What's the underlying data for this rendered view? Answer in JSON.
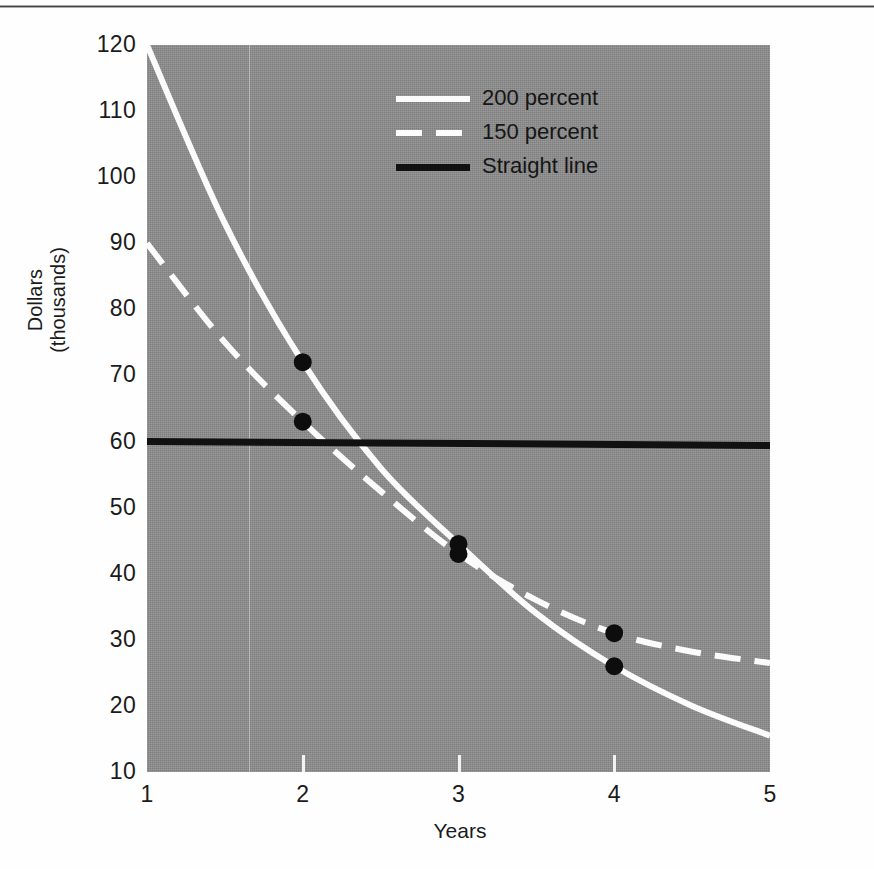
{
  "figure": {
    "background_color": "#fefefe",
    "plot_background_color": "#8d8d8d"
  },
  "chart_data": {
    "type": "line",
    "title": "",
    "xlabel": "Years",
    "ylabel": "Dollars\n(thousands)",
    "xlim": [
      1,
      5
    ],
    "ylim": [
      10,
      120
    ],
    "xticks": [
      "1",
      "2",
      "3",
      "4",
      "5"
    ],
    "yticks": [
      "10",
      "20",
      "30",
      "40",
      "50",
      "60",
      "70",
      "80",
      "90",
      "100",
      "110",
      "120"
    ],
    "grid": false,
    "legend_position": "upper right",
    "series": [
      {
        "name": "200 percent",
        "style": "solid",
        "color": "#fbfbfb",
        "x": [
          1,
          1.5,
          2,
          2.5,
          3,
          3.5,
          4,
          4.5,
          5
        ],
        "values": [
          120,
          93,
          72,
          56,
          44.5,
          34,
          26,
          20,
          15.5
        ],
        "markers": [
          {
            "x": 2,
            "y": 72
          },
          {
            "x": 3,
            "y": 44.5
          },
          {
            "x": 4,
            "y": 26
          }
        ]
      },
      {
        "name": "150 percent",
        "style": "dashed",
        "color": "#fbfbfb",
        "x": [
          1,
          1.5,
          2,
          2.5,
          3,
          3.5,
          4,
          4.5,
          5
        ],
        "values": [
          90,
          75,
          63,
          52.5,
          43,
          36,
          31,
          28.2,
          26.5
        ],
        "markers": [
          {
            "x": 2,
            "y": 63
          },
          {
            "x": 3,
            "y": 43
          },
          {
            "x": 4,
            "y": 31
          }
        ]
      },
      {
        "name": "Straight line",
        "style": "solid",
        "color": "#111111",
        "x": [
          1,
          5
        ],
        "values": [
          60,
          59.4
        ],
        "markers": []
      }
    ],
    "marker_color": "#0d0d0d"
  },
  "legend": {
    "items": [
      {
        "label": "200 percent",
        "swatch": "solid-white-line"
      },
      {
        "label": "150 percent",
        "swatch": "dashed-white-line"
      },
      {
        "label": "Straight line",
        "swatch": "solid-black-line"
      }
    ]
  }
}
